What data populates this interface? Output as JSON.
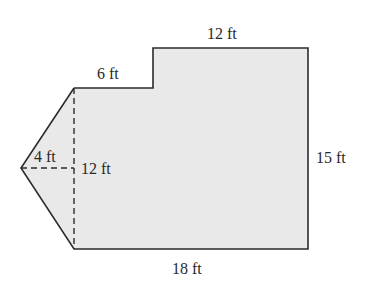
{
  "figure": {
    "type": "composite-shape-area-diagram",
    "fill_color": "#e9e9e9",
    "stroke_color": "#2b2b2b",
    "labels": {
      "top_right": "12 ft",
      "top_left": "6 ft",
      "right": "15 ft",
      "bottom": "18 ft",
      "triangle_height": "4 ft",
      "triangle_base": "12 ft"
    }
  }
}
